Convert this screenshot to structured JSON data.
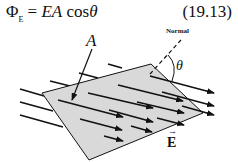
{
  "equation": {
    "phi": "Φ",
    "phi_subscript": "E",
    "rhs_prefix": " = ",
    "E": "E",
    "A": "A",
    "cos": "cos",
    "theta": "θ",
    "number": "(19.13)"
  },
  "diagram": {
    "surface_label": "A",
    "normal_label": "Normal",
    "angle_label": "θ",
    "field_label": "E",
    "field_vector_mark": "→",
    "colors": {
      "surface_fill": "#d9d9d9",
      "lines": "#111111"
    }
  }
}
